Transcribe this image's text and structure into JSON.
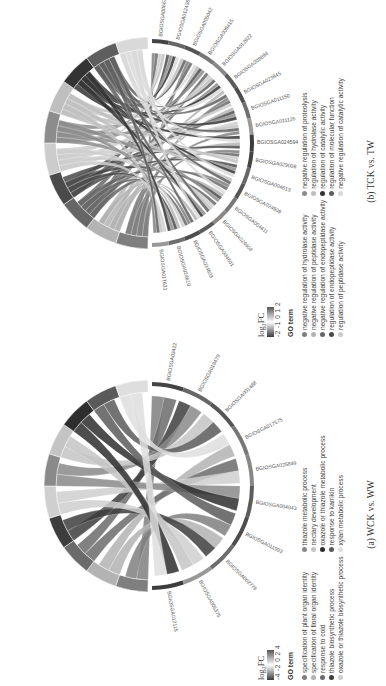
{
  "figure": {
    "panels": [
      {
        "id": "b",
        "caption": "(b) TCK  vs.  TW",
        "scale": {
          "title": "log₂FC",
          "ticks": "-2 -1 0 1 2",
          "colors": [
            "#3a3a3a",
            "#ffffff",
            "#555555"
          ]
        },
        "go_title": "GO term",
        "genes": [
          "BGIOSGA006678",
          "BGIOSGA012436",
          "BGIOSGA005042",
          "BGIOSGA009415",
          "BGIOSGA012922",
          "BGIOSGA008694",
          "BGIOSGA023845",
          "BGIOSGA011150",
          "BGIOSGA011126",
          "BGIOSGA024594",
          "BGIOSGA029008",
          "BGIOSGA004613",
          "BGIOSGA024909",
          "BGIOSGA004611",
          "BGIOSGA024908",
          "BGIOSGA004601",
          "BGIOSGA004603",
          "BGIOSGA024610",
          "BGIOSGA017631"
        ],
        "terms": [
          {
            "label": "negative regulation of hydrolase activity",
            "color": "#7f7f7f"
          },
          {
            "label": "negative regulation of peptidase activity",
            "color": "#b3b3b3"
          },
          {
            "label": "negative regulation of endopeptidase activity",
            "color": "#666666"
          },
          {
            "label": "regulation of endopeptidase activity",
            "color": "#4a4a4a"
          },
          {
            "label": "regulation of peptidase activity",
            "color": "#cccccc"
          },
          {
            "label": "negative regulation of proteolysis",
            "color": "#8c8c8c"
          },
          {
            "label": "regulation of hydrolase activity",
            "color": "#bfbfbf"
          },
          {
            "label": "regulation of catalytic activity",
            "color": "#333333"
          },
          {
            "label": "regulation of molecular function",
            "color": "#5e5e5e"
          },
          {
            "label": "negative regulation of catalytic activity",
            "color": "#d9d9d9"
          }
        ]
      },
      {
        "id": "a",
        "caption": "(a) WCK  vs.  WW",
        "scale": {
          "title": "log₂FC",
          "ticks": "-4 -2 0 2 4",
          "colors": [
            "#3a3a3a",
            "#ffffff",
            "#555555"
          ]
        },
        "go_title": "GO term",
        "genes": [
          "BGIOSGA034225",
          "BGIOSGA019479",
          "BGIOSGA001488",
          "BGIOSGA017575",
          "BGIOSGA025849",
          "BGIOSGA004043",
          "BGIOSGA011993",
          "BGIOSGA002779",
          "BGIOSGA005375",
          "BGIOSGA012115"
        ],
        "terms": [
          {
            "label": "specification of plant organ identity",
            "color": "#7f7f7f"
          },
          {
            "label": "specification of floral organ identity",
            "color": "#b3b3b3"
          },
          {
            "label": "response to cold",
            "color": "#6b6b6b"
          },
          {
            "label": "thiazole biosynthetic process",
            "color": "#3d3d3d"
          },
          {
            "label": "oxazole or thiazole biosynthetic process",
            "color": "#cfcfcf"
          },
          {
            "label": "thiazole metabolic process",
            "color": "#8a8a8a"
          },
          {
            "label": "nectary development",
            "color": "#c4c4c4"
          },
          {
            "label": "oxazole or thiazole metabolic process",
            "color": "#2e2e2e"
          },
          {
            "label": "response to karrikin",
            "color": "#5a5a5a"
          },
          {
            "label": "xylan metabolic process",
            "color": "#dedede"
          }
        ]
      }
    ]
  }
}
